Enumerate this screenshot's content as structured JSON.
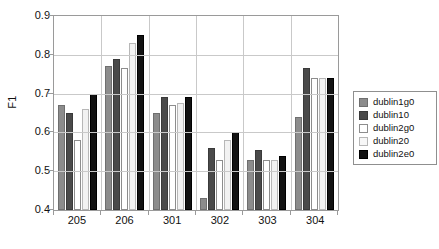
{
  "chart_data": {
    "type": "bar",
    "title": "",
    "xlabel": "",
    "ylabel": "F1",
    "categories": [
      "205",
      "206",
      "301",
      "302",
      "303",
      "304"
    ],
    "ylim": [
      0.4,
      0.9
    ],
    "yticks": [
      "0.9",
      "0.8",
      "0.7",
      "0.6",
      "0.5",
      "0.4"
    ],
    "ytick_values": [
      0.9,
      0.8,
      0.7,
      0.6,
      0.5,
      0.4
    ],
    "grid": true,
    "legend_position": "right",
    "series": [
      {
        "name": "dublin1g0",
        "color": "#8c8c8c",
        "values": [
          0.67,
          0.77,
          0.65,
          0.43,
          0.53,
          0.64
        ]
      },
      {
        "name": "dublin10",
        "color": "#4a4a4a",
        "values": [
          0.65,
          0.79,
          0.69,
          0.56,
          0.555,
          0.765
        ]
      },
      {
        "name": "dublin2g0",
        "color": "#ffffff",
        "values": [
          0.58,
          0.765,
          0.67,
          0.53,
          0.53,
          0.74
        ]
      },
      {
        "name": "dublin20",
        "color": "#f2f2f2",
        "values": [
          0.66,
          0.83,
          0.675,
          0.58,
          0.53,
          0.74
        ]
      },
      {
        "name": "dublin2e0",
        "color": "#121212",
        "values": [
          0.7,
          0.85,
          0.69,
          0.6,
          0.54,
          0.74
        ]
      }
    ]
  }
}
